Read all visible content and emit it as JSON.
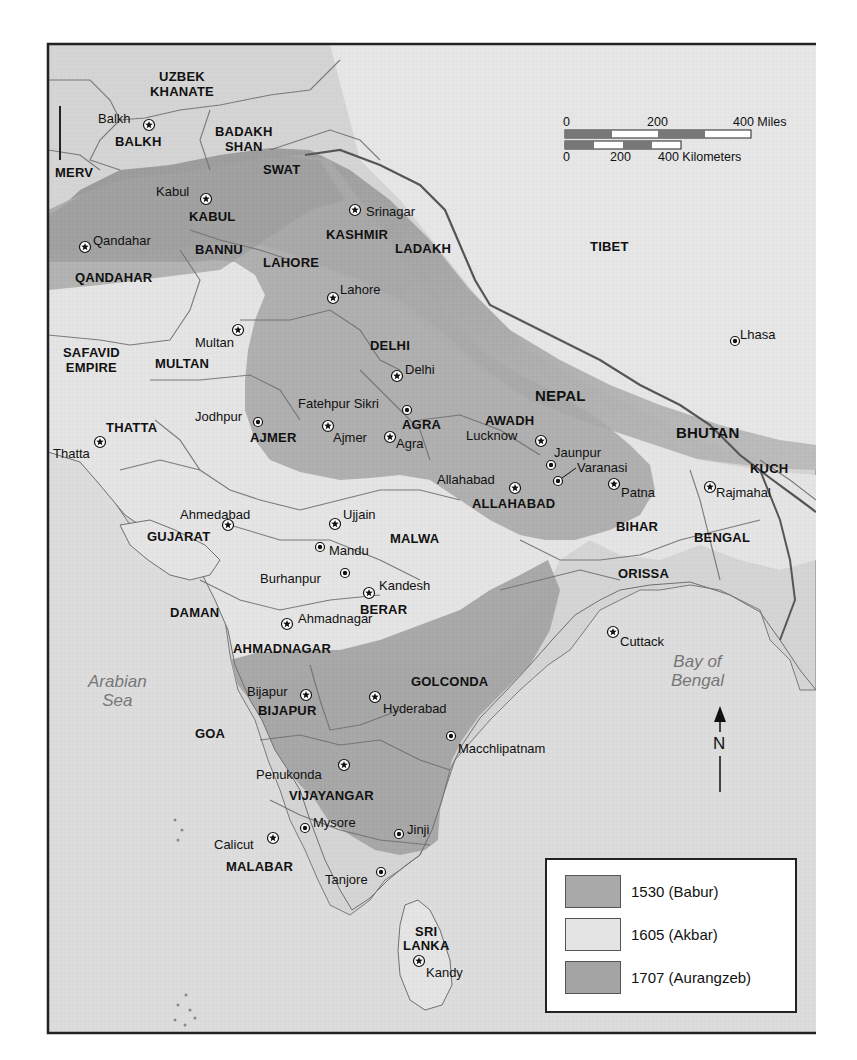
{
  "map": {
    "scale": {
      "miles": {
        "labels": [
          "0",
          "200",
          "400 Miles"
        ]
      },
      "kilometers": {
        "labels": [
          "0",
          "200",
          "400 Kilometers"
        ]
      }
    },
    "north_arrow": {
      "label": "N"
    },
    "seas": [
      {
        "id": "arabian-sea",
        "label": "Arabian\nSea",
        "line1": "Arabian",
        "line2": "Sea"
      },
      {
        "id": "bay-of-bengal",
        "label": "Bay of\nBengal",
        "line1": "Bay of",
        "line2": "Bengal"
      }
    ],
    "regions": [
      {
        "id": "uzbek-khanate",
        "line1": "UZBEK",
        "line2": "KHANATE"
      },
      {
        "id": "balkh",
        "label": "BALKH"
      },
      {
        "id": "badakhshan",
        "line1": "BADAKH",
        "line2": "SHAN"
      },
      {
        "id": "merv",
        "label": "MERV"
      },
      {
        "id": "swat",
        "label": "SWAT"
      },
      {
        "id": "kabul",
        "label": "KABUL"
      },
      {
        "id": "kashmir",
        "label": "KASHMIR"
      },
      {
        "id": "ladakh",
        "label": "LADAKH"
      },
      {
        "id": "bannu",
        "label": "BANNU"
      },
      {
        "id": "lahore",
        "label": "LAHORE"
      },
      {
        "id": "qandahar",
        "label": "QANDAHAR"
      },
      {
        "id": "tibet",
        "label": "TIBET"
      },
      {
        "id": "safavid-empire",
        "line1": "SAFAVID",
        "line2": "EMPIRE"
      },
      {
        "id": "multan",
        "label": "MULTAN"
      },
      {
        "id": "delhi",
        "label": "DELHI"
      },
      {
        "id": "nepal",
        "label": "NEPAL"
      },
      {
        "id": "thatta",
        "label": "THATTA"
      },
      {
        "id": "ajmer",
        "label": "AJMER"
      },
      {
        "id": "agra",
        "label": "AGRA"
      },
      {
        "id": "awadh",
        "label": "AWADH"
      },
      {
        "id": "bhutan",
        "label": "BHUTAN"
      },
      {
        "id": "kuch",
        "label": "KUCH"
      },
      {
        "id": "allahabad",
        "label": "ALLAHABAD"
      },
      {
        "id": "bihar",
        "label": "BIHAR"
      },
      {
        "id": "gujarat",
        "label": "GUJARAT"
      },
      {
        "id": "malwa",
        "label": "MALWA"
      },
      {
        "id": "bengal",
        "label": "BENGAL"
      },
      {
        "id": "orissa",
        "label": "ORISSA"
      },
      {
        "id": "daman",
        "label": "DAMAN"
      },
      {
        "id": "berar",
        "label": "BERAR"
      },
      {
        "id": "ahmadnagar",
        "label": "AHMADNAGAR"
      },
      {
        "id": "golconda",
        "label": "GOLCONDA"
      },
      {
        "id": "bijapur",
        "label": "BIJAPUR"
      },
      {
        "id": "goa",
        "label": "GOA"
      },
      {
        "id": "vijayangar",
        "label": "VIJAYANGAR"
      },
      {
        "id": "malabar",
        "label": "MALABAR"
      },
      {
        "id": "sri-lanka",
        "line1": "SRI",
        "line2": "LANKA"
      }
    ],
    "cities": [
      {
        "id": "balkh",
        "label": "Balkh",
        "type": "capital"
      },
      {
        "id": "kabul",
        "label": "Kabul",
        "type": "capital"
      },
      {
        "id": "srinagar",
        "label": "Srinagar",
        "type": "capital"
      },
      {
        "id": "qandahar",
        "label": "Qandahar",
        "type": "capital"
      },
      {
        "id": "lahore",
        "label": "Lahore",
        "type": "capital"
      },
      {
        "id": "multan",
        "label": "Multan",
        "type": "capital"
      },
      {
        "id": "lhasa",
        "label": "Lhasa",
        "type": "city"
      },
      {
        "id": "delhi",
        "label": "Delhi",
        "type": "capital"
      },
      {
        "id": "fatehpur-sikri",
        "label": "Fatehpur Sikri",
        "type": "city"
      },
      {
        "id": "jodhpur",
        "label": "Jodhpur",
        "type": "city"
      },
      {
        "id": "ajmer",
        "label": "Ajmer",
        "type": "capital"
      },
      {
        "id": "agra",
        "label": "Agra",
        "type": "capital"
      },
      {
        "id": "lucknow",
        "label": "Lucknow",
        "type": "capital"
      },
      {
        "id": "jaunpur",
        "label": "Jaunpur",
        "type": "city"
      },
      {
        "id": "varanasi",
        "label": "Varanasi",
        "type": "city"
      },
      {
        "id": "thatta",
        "label": "Thatta",
        "type": "capital"
      },
      {
        "id": "allahabad",
        "label": "Allahabad",
        "type": "capital"
      },
      {
        "id": "patna",
        "label": "Patna",
        "type": "capital"
      },
      {
        "id": "rajmahal",
        "label": "Rajmahal",
        "type": "capital"
      },
      {
        "id": "ahmedabad",
        "label": "Ahmedabad",
        "type": "capital"
      },
      {
        "id": "ujjain",
        "label": "Ujjain",
        "type": "capital"
      },
      {
        "id": "mandu",
        "label": "Mandu",
        "type": "city"
      },
      {
        "id": "burhanpur",
        "label": "Burhanpur",
        "type": "city"
      },
      {
        "id": "kandesh",
        "label": "Kandesh",
        "type": "capital"
      },
      {
        "id": "ahmadnagar",
        "label": "Ahmadnagar",
        "type": "capital"
      },
      {
        "id": "cuttack",
        "label": "Cuttack",
        "type": "capital"
      },
      {
        "id": "bijapur",
        "label": "Bijapur",
        "type": "capital"
      },
      {
        "id": "hyderabad",
        "label": "Hyderabad",
        "type": "capital"
      },
      {
        "id": "macchlipatnam",
        "label": "Macchlipatnam",
        "type": "city"
      },
      {
        "id": "penukonda",
        "label": "Penukonda",
        "type": "capital"
      },
      {
        "id": "calicut",
        "label": "Calicut",
        "type": "capital"
      },
      {
        "id": "mysore",
        "label": "Mysore",
        "type": "city"
      },
      {
        "id": "jinji",
        "label": "Jinji",
        "type": "city"
      },
      {
        "id": "tanjore",
        "label": "Tanjore",
        "type": "city"
      },
      {
        "id": "kandy",
        "label": "Kandy",
        "type": "capital"
      }
    ],
    "legend": {
      "items": [
        {
          "label": "1530 (Babur)",
          "color": "#a9a9a9"
        },
        {
          "label": "1605 (Akbar)",
          "color": "#e4e4e4"
        },
        {
          "label": "1707 (Aurangzeb)",
          "color": "#a4a4a4"
        }
      ]
    },
    "colors": {
      "sea": "#dcdcdc",
      "land_other": "#d2d2d2",
      "mountain": "#9a9a9a",
      "empire_1530": "#a9a9a9",
      "empire_1605": "#e4e4e4",
      "empire_1707": "#a4a4a4",
      "border": "#6f6f6f",
      "frame": "#222222"
    }
  }
}
